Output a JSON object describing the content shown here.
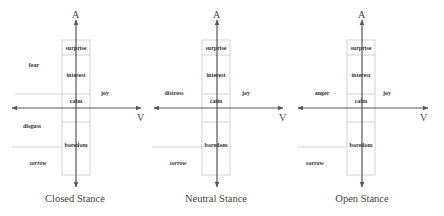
{
  "panels": [
    {
      "caption": "Closed Stance",
      "axis_y_label": "A",
      "axis_x_label": "V",
      "labels": {
        "surprise": "surprise",
        "interest": "interest",
        "calm": "calm",
        "boredom": "boredom",
        "upper_left": "fear",
        "right": "joy",
        "lower_left": "disgust",
        "bottom_left": "sorrow"
      }
    },
    {
      "caption": "Neutral Stance",
      "axis_y_label": "A",
      "axis_x_label": "V",
      "labels": {
        "surprise": "surprise",
        "interest": "interest",
        "calm": "calm",
        "boredom": "boredom",
        "upper_left": "distress",
        "right": "joy",
        "bottom_left": "sorrow"
      }
    },
    {
      "caption": "Open Stance",
      "axis_y_label": "A",
      "axis_x_label": "V",
      "labels": {
        "surprise": "surprise",
        "interest": "interest",
        "calm": "calm",
        "boredom": "boredom",
        "upper_left": "anger",
        "right": "joy",
        "bottom_left": "sorrow"
      }
    }
  ],
  "colors": {
    "axis": "#555555",
    "grid": "#c8c8c8",
    "text": "#333333"
  }
}
